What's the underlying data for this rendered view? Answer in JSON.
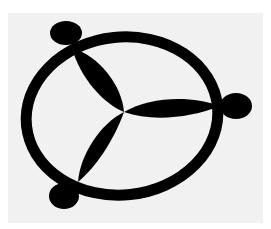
{
  "figure": {
    "colors": {
      "background": "#ffffff",
      "paper": "#f1f1f1",
      "ink": "#000000"
    },
    "lobe_count": 3,
    "knob_count": 3
  }
}
